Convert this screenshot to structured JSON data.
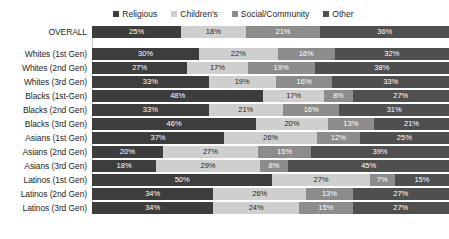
{
  "chart_data": {
    "type": "bar",
    "orientation": "horizontal",
    "stacked": true,
    "stack_unit": "percent",
    "title": "",
    "xlabel": "",
    "ylabel": "",
    "xlim": [
      0,
      100
    ],
    "grid": false,
    "legend_position": "top-center",
    "series": [
      {
        "name": "Religious",
        "color": "#3d3d3d",
        "values": [
          25,
          30,
          27,
          33,
          48,
          33,
          46,
          37,
          20,
          18,
          50,
          34,
          34
        ]
      },
      {
        "name": "Children's",
        "color": "#cfcfcf",
        "values": [
          18,
          22,
          17,
          19,
          17,
          21,
          20,
          26,
          27,
          29,
          27,
          26,
          24
        ]
      },
      {
        "name": "Social/Community",
        "color": "#8c8c8c",
        "values": [
          21,
          16,
          19,
          16,
          8,
          16,
          13,
          12,
          15,
          8,
          7,
          13,
          15
        ]
      },
      {
        "name": "Other",
        "color": "#4f4f4f",
        "values": [
          36,
          32,
          38,
          33,
          27,
          31,
          21,
          25,
          39,
          45,
          15,
          27,
          27
        ]
      }
    ],
    "categories": [
      "OVERALL",
      "Whites (1st Gen)",
      "Whites (2nd Gen)",
      "Whites (3rd Gen)",
      "Blacks (1st-Gen)",
      "Blacks (2nd Gen)",
      "Blacks (3rd Gen)",
      "Asians (1st Gen)",
      "Asians (2nd Gen)",
      "Asians (3rd Gen)",
      "Latinos (1st Gen)",
      "Latinos (2nd Gen)",
      "Latinos (3rd Gen)"
    ],
    "rows": [
      {
        "label": "OVERALL",
        "gap_after": true,
        "segments": [
          {
            "series": "Religious",
            "value": 25,
            "label": "25%"
          },
          {
            "series": "Children's",
            "value": 18,
            "label": "18%"
          },
          {
            "series": "Social/Community",
            "value": 21,
            "label": "21%"
          },
          {
            "series": "Other",
            "value": 36,
            "label": "36%"
          }
        ]
      },
      {
        "label": "Whites (1st Gen)",
        "gap_after": false,
        "segments": [
          {
            "series": "Religious",
            "value": 30,
            "label": "30%"
          },
          {
            "series": "Children's",
            "value": 22,
            "label": "22%"
          },
          {
            "series": "Social/Community",
            "value": 16,
            "label": "16%"
          },
          {
            "series": "Other",
            "value": 32,
            "label": "32%"
          }
        ]
      },
      {
        "label": "Whites (2nd Gen)",
        "gap_after": false,
        "segments": [
          {
            "series": "Religious",
            "value": 27,
            "label": "27%"
          },
          {
            "series": "Children's",
            "value": 17,
            "label": "17%"
          },
          {
            "series": "Social/Community",
            "value": 19,
            "label": "19%"
          },
          {
            "series": "Other",
            "value": 38,
            "label": "38%"
          }
        ]
      },
      {
        "label": "Whites (3rd Gen)",
        "gap_after": false,
        "segments": [
          {
            "series": "Religious",
            "value": 33,
            "label": "33%"
          },
          {
            "series": "Children's",
            "value": 19,
            "label": "19%"
          },
          {
            "series": "Social/Community",
            "value": 16,
            "label": "16%"
          },
          {
            "series": "Other",
            "value": 33,
            "label": "33%"
          }
        ]
      },
      {
        "label": "Blacks (1st-Gen)",
        "gap_after": false,
        "segments": [
          {
            "series": "Religious",
            "value": 48,
            "label": "48%"
          },
          {
            "series": "Children's",
            "value": 17,
            "label": "17%"
          },
          {
            "series": "Social/Community",
            "value": 8,
            "label": "8%"
          },
          {
            "series": "Other",
            "value": 27,
            "label": "27%"
          }
        ]
      },
      {
        "label": "Blacks (2nd Gen)",
        "gap_after": false,
        "segments": [
          {
            "series": "Religious",
            "value": 33,
            "label": "33%"
          },
          {
            "series": "Children's",
            "value": 21,
            "label": "21%"
          },
          {
            "series": "Social/Community",
            "value": 16,
            "label": "16%"
          },
          {
            "series": "Other",
            "value": 31,
            "label": "31%"
          }
        ]
      },
      {
        "label": "Blacks (3rd Gen)",
        "gap_after": false,
        "segments": [
          {
            "series": "Religious",
            "value": 46,
            "label": "46%"
          },
          {
            "series": "Children's",
            "value": 20,
            "label": "20%"
          },
          {
            "series": "Social/Community",
            "value": 13,
            "label": "13%"
          },
          {
            "series": "Other",
            "value": 21,
            "label": "21%"
          }
        ]
      },
      {
        "label": "Asians (1st Gen)",
        "gap_after": false,
        "segments": [
          {
            "series": "Religious",
            "value": 37,
            "label": "37%"
          },
          {
            "series": "Children's",
            "value": 26,
            "label": "26%"
          },
          {
            "series": "Social/Community",
            "value": 12,
            "label": "12%"
          },
          {
            "series": "Other",
            "value": 25,
            "label": "25%"
          }
        ]
      },
      {
        "label": "Asians (2nd Gen)",
        "gap_after": false,
        "segments": [
          {
            "series": "Religious",
            "value": 20,
            "label": "20%"
          },
          {
            "series": "Children's",
            "value": 27,
            "label": "27%"
          },
          {
            "series": "Social/Community",
            "value": 15,
            "label": "15%"
          },
          {
            "series": "Other",
            "value": 39,
            "label": "39%"
          }
        ]
      },
      {
        "label": "Asians (3rd Gen)",
        "gap_after": false,
        "segments": [
          {
            "series": "Religious",
            "value": 18,
            "label": "18%"
          },
          {
            "series": "Children's",
            "value": 29,
            "label": "29%"
          },
          {
            "series": "Social/Community",
            "value": 8,
            "label": "8%"
          },
          {
            "series": "Other",
            "value": 45,
            "label": "45%"
          }
        ]
      },
      {
        "label": "Latinos (1st Gen)",
        "gap_after": false,
        "segments": [
          {
            "series": "Religious",
            "value": 50,
            "label": "50%"
          },
          {
            "series": "Children's",
            "value": 27,
            "label": "27%"
          },
          {
            "series": "Social/Community",
            "value": 7,
            "label": "7%"
          },
          {
            "series": "Other",
            "value": 15,
            "label": "15%"
          }
        ]
      },
      {
        "label": "Latinos (2nd Gen)",
        "gap_after": false,
        "segments": [
          {
            "series": "Religious",
            "value": 34,
            "label": "34%"
          },
          {
            "series": "Children's",
            "value": 26,
            "label": "26%"
          },
          {
            "series": "Social/Community",
            "value": 13,
            "label": "13%"
          },
          {
            "series": "Other",
            "value": 27,
            "label": "27%"
          }
        ]
      },
      {
        "label": "Latinos (3rd Gen)",
        "gap_after": false,
        "segments": [
          {
            "series": "Religious",
            "value": 34,
            "label": "34%"
          },
          {
            "series": "Children's",
            "value": 24,
            "label": "24%"
          },
          {
            "series": "Social/Community",
            "value": 15,
            "label": "15%"
          },
          {
            "series": "Other",
            "value": 27,
            "label": "27%"
          }
        ]
      }
    ]
  },
  "legend": {
    "items": [
      {
        "label": "Religious",
        "color": "#3d3d3d"
      },
      {
        "label": "Children's",
        "color": "#cfcfcf"
      },
      {
        "label": "Social/Community",
        "color": "#8c8c8c"
      },
      {
        "label": "Other",
        "color": "#4f4f4f"
      }
    ]
  }
}
